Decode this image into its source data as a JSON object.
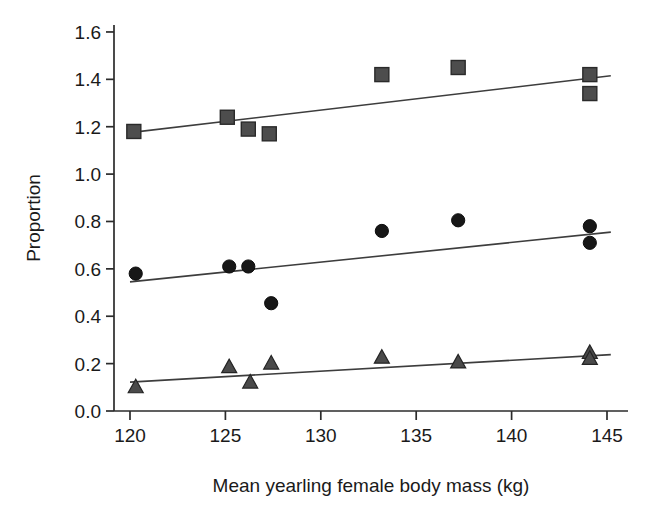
{
  "chart_data": {
    "type": "scatter",
    "title": "",
    "subtitle": "",
    "xlabel": "Mean yearling female body mass (kg)",
    "ylabel": "Proportion",
    "xlim": [
      119.0,
      146.0
    ],
    "ylim": [
      0.0,
      1.7
    ],
    "grid": false,
    "legend_position": "none",
    "xticks": [
      120,
      125,
      130,
      135,
      140,
      145
    ],
    "xtick_labels": [
      "120",
      "125",
      "130",
      "135",
      "140",
      "145"
    ],
    "yticks": [
      0.0,
      0.2,
      0.4,
      0.6,
      0.8,
      1.0,
      1.2,
      1.4,
      1.6
    ],
    "ytick_labels": [
      "0.0",
      "0.2",
      "0.4",
      "0.6",
      "0.8",
      "1.0",
      "1.2",
      "1.4",
      "1.6"
    ],
    "series": [
      {
        "name": "squares",
        "marker": "square",
        "color": "#4d4d4d",
        "points": [
          {
            "x": 120.2,
            "y": 1.18
          },
          {
            "x": 125.1,
            "y": 1.24
          },
          {
            "x": 126.2,
            "y": 1.19
          },
          {
            "x": 127.3,
            "y": 1.17
          },
          {
            "x": 133.2,
            "y": 1.42
          },
          {
            "x": 137.2,
            "y": 1.45
          },
          {
            "x": 144.1,
            "y": 1.42
          },
          {
            "x": 144.1,
            "y": 1.34
          }
        ],
        "trendline": {
          "x1": 120.0,
          "y1": 1.175,
          "x2": 145.2,
          "y2": 1.415
        }
      },
      {
        "name": "circles",
        "marker": "circle",
        "color": "#171717",
        "points": [
          {
            "x": 120.3,
            "y": 0.58
          },
          {
            "x": 125.2,
            "y": 0.61
          },
          {
            "x": 126.2,
            "y": 0.61
          },
          {
            "x": 127.4,
            "y": 0.455
          },
          {
            "x": 133.2,
            "y": 0.76
          },
          {
            "x": 137.2,
            "y": 0.805
          },
          {
            "x": 144.1,
            "y": 0.78
          },
          {
            "x": 144.1,
            "y": 0.71
          }
        ],
        "trendline": {
          "x1": 120.0,
          "y1": 0.545,
          "x2": 145.2,
          "y2": 0.755
        }
      },
      {
        "name": "triangles",
        "marker": "triangle",
        "color": "#4a4a4a",
        "points": [
          {
            "x": 120.3,
            "y": 0.1
          },
          {
            "x": 125.2,
            "y": 0.185
          },
          {
            "x": 126.3,
            "y": 0.12
          },
          {
            "x": 127.4,
            "y": 0.2
          },
          {
            "x": 133.2,
            "y": 0.225
          },
          {
            "x": 137.2,
            "y": 0.205
          },
          {
            "x": 144.1,
            "y": 0.245
          },
          {
            "x": 144.1,
            "y": 0.22
          }
        ],
        "trendline": {
          "x1": 120.0,
          "y1": 0.122,
          "x2": 145.2,
          "y2": 0.238
        }
      }
    ]
  },
  "axes": {
    "geometry": {
      "x_origin_px": 130,
      "px_per_kg": 19.08,
      "y_zero_px": 411,
      "px_per_unit": 236.9,
      "axis_x_px": 114,
      "axis_top_px": 25,
      "axis_right_px": 628
    }
  }
}
